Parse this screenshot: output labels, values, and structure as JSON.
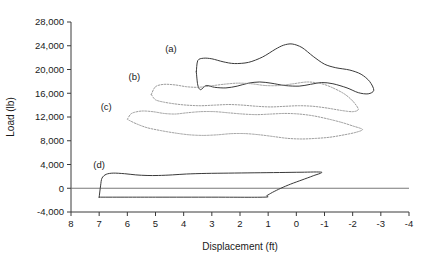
{
  "chart_data": {
    "type": "line",
    "title": "",
    "xlabel": "Displacement (ft)",
    "ylabel": "Load (lb)",
    "xlim": [
      8,
      -4
    ],
    "ylim": [
      -4000,
      28000
    ],
    "x_ticks": [
      "8",
      "7",
      "6",
      "5",
      "4",
      "3",
      "2",
      "1",
      "0",
      "-1",
      "-2",
      "-3",
      "-4"
    ],
    "x_tick_values": [
      8,
      7,
      6,
      5,
      4,
      3,
      2,
      1,
      0,
      -1,
      -2,
      -3,
      -4
    ],
    "y_ticks": [
      "28,000",
      "24,000",
      "20,000",
      "16,000",
      "12,000",
      "8,000",
      "4,000",
      "0",
      "-4,000"
    ],
    "y_tick_values": [
      28000,
      24000,
      20000,
      16000,
      12000,
      8000,
      4000,
      0,
      -4000
    ],
    "grid": false,
    "legend": "inline-curve-labels",
    "annotations": [
      {
        "text": "(a)",
        "x": 4.45,
        "y": 23000
      },
      {
        "text": "(b)",
        "x": 5.75,
        "y": 18300
      },
      {
        "text": "(c)",
        "x": 6.75,
        "y": 13200
      },
      {
        "text": "(d)",
        "x": 7.0,
        "y": 3400
      }
    ],
    "series": [
      {
        "name": "(a)",
        "style": "solid",
        "color": "#3a3a3a",
        "closed_loop": true,
        "upper_branch": [
          [
            3.55,
            19600
          ],
          [
            3.5,
            21500
          ],
          [
            3.3,
            21900
          ],
          [
            3.0,
            21800
          ],
          [
            2.6,
            21300
          ],
          [
            2.2,
            21000
          ],
          [
            1.7,
            21200
          ],
          [
            1.2,
            22100
          ],
          [
            0.75,
            23400
          ],
          [
            0.45,
            24100
          ],
          [
            0.15,
            24300
          ],
          [
            -0.2,
            23700
          ],
          [
            -0.6,
            22200
          ],
          [
            -1.0,
            20900
          ],
          [
            -1.4,
            20300
          ],
          [
            -1.9,
            19900
          ],
          [
            -2.3,
            19200
          ],
          [
            -2.6,
            18000
          ],
          [
            -2.75,
            16500
          ]
        ],
        "lower_branch": [
          [
            -2.75,
            16500
          ],
          [
            -2.55,
            15900
          ],
          [
            -2.2,
            16100
          ],
          [
            -1.8,
            16900
          ],
          [
            -1.3,
            17600
          ],
          [
            -0.9,
            17800
          ],
          [
            -0.5,
            17500
          ],
          [
            -0.1,
            17200
          ],
          [
            0.4,
            17300
          ],
          [
            0.9,
            17700
          ],
          [
            1.3,
            17900
          ],
          [
            1.7,
            17700
          ],
          [
            2.1,
            17200
          ],
          [
            2.5,
            16900
          ],
          [
            2.9,
            17000
          ],
          [
            3.2,
            17300
          ],
          [
            3.4,
            16600
          ],
          [
            3.5,
            17400
          ],
          [
            3.55,
            19600
          ]
        ]
      },
      {
        "name": "(b)",
        "style": "dotted",
        "color": "#8f8f8f",
        "closed_loop": true,
        "upper_branch": [
          [
            5.15,
            15800
          ],
          [
            5.0,
            17100
          ],
          [
            4.7,
            17500
          ],
          [
            4.3,
            17400
          ],
          [
            3.9,
            17100
          ],
          [
            3.5,
            17000
          ],
          [
            3.1,
            17200
          ],
          [
            2.6,
            17500
          ],
          [
            2.1,
            17700
          ],
          [
            1.6,
            17600
          ],
          [
            1.1,
            17300
          ],
          [
            0.6,
            17300
          ],
          [
            0.1,
            17600
          ],
          [
            -0.4,
            17900
          ],
          [
            -0.9,
            17600
          ],
          [
            -1.3,
            16900
          ],
          [
            -1.7,
            15900
          ],
          [
            -2.0,
            14700
          ],
          [
            -2.2,
            13300
          ]
        ],
        "lower_branch": [
          [
            -2.2,
            13300
          ],
          [
            -2.0,
            12900
          ],
          [
            -1.6,
            13100
          ],
          [
            -1.1,
            13500
          ],
          [
            -0.6,
            13800
          ],
          [
            -0.1,
            13900
          ],
          [
            0.4,
            13800
          ],
          [
            0.9,
            13700
          ],
          [
            1.4,
            13800
          ],
          [
            1.9,
            14000
          ],
          [
            2.4,
            14100
          ],
          [
            2.9,
            14000
          ],
          [
            3.4,
            13900
          ],
          [
            3.9,
            14000
          ],
          [
            4.3,
            14200
          ],
          [
            4.7,
            14500
          ],
          [
            5.0,
            14900
          ],
          [
            5.15,
            15800
          ]
        ]
      },
      {
        "name": "(c)",
        "style": "dotted",
        "color": "#8f8f8f",
        "closed_loop": true,
        "upper_branch": [
          [
            6.0,
            11600
          ],
          [
            5.85,
            12600
          ],
          [
            5.5,
            13000
          ],
          [
            5.1,
            12900
          ],
          [
            4.7,
            12600
          ],
          [
            4.3,
            12500
          ],
          [
            3.9,
            12700
          ],
          [
            3.4,
            12900
          ],
          [
            2.9,
            12900
          ],
          [
            2.4,
            12700
          ],
          [
            1.9,
            12500
          ],
          [
            1.4,
            12400
          ],
          [
            0.9,
            12500
          ],
          [
            0.4,
            12600
          ],
          [
            -0.1,
            12500
          ],
          [
            -0.6,
            12200
          ],
          [
            -1.1,
            11700
          ],
          [
            -1.6,
            11100
          ],
          [
            -2.0,
            10500
          ],
          [
            -2.35,
            9900
          ]
        ],
        "lower_branch": [
          [
            -2.35,
            9900
          ],
          [
            -2.1,
            9400
          ],
          [
            -1.7,
            9000
          ],
          [
            -1.2,
            8600
          ],
          [
            -0.7,
            8400
          ],
          [
            -0.2,
            8300
          ],
          [
            0.3,
            8400
          ],
          [
            0.8,
            8700
          ],
          [
            1.3,
            9000
          ],
          [
            1.8,
            9200
          ],
          [
            2.3,
            9200
          ],
          [
            2.8,
            9000
          ],
          [
            3.3,
            8900
          ],
          [
            3.8,
            9000
          ],
          [
            4.3,
            9300
          ],
          [
            4.8,
            9700
          ],
          [
            5.3,
            10200
          ],
          [
            5.7,
            10900
          ],
          [
            6.0,
            11600
          ]
        ]
      },
      {
        "name": "(d)",
        "style": "solid",
        "color": "#3a3a3a",
        "closed_loop": true,
        "upper_branch": [
          [
            7.0,
            -1500
          ],
          [
            6.95,
            400
          ],
          [
            6.9,
            1700
          ],
          [
            6.75,
            2350
          ],
          [
            6.5,
            2550
          ],
          [
            6.1,
            2450
          ],
          [
            5.7,
            2250
          ],
          [
            5.3,
            2150
          ],
          [
            4.9,
            2150
          ],
          [
            4.4,
            2250
          ],
          [
            3.9,
            2400
          ],
          [
            3.2,
            2500
          ],
          [
            2.4,
            2550
          ],
          [
            1.5,
            2600
          ],
          [
            0.6,
            2650
          ],
          [
            -0.2,
            2700
          ],
          [
            -0.9,
            2700
          ]
        ],
        "lower_branch": [
          [
            -0.9,
            2700
          ],
          [
            -0.6,
            2100
          ],
          [
            -0.2,
            1400
          ],
          [
            0.2,
            700
          ],
          [
            0.55,
            0
          ],
          [
            0.85,
            -700
          ],
          [
            1.05,
            -1250
          ],
          [
            1.15,
            -1500
          ],
          [
            3.0,
            -1500
          ],
          [
            5.0,
            -1500
          ],
          [
            7.0,
            -1500
          ]
        ]
      }
    ]
  }
}
